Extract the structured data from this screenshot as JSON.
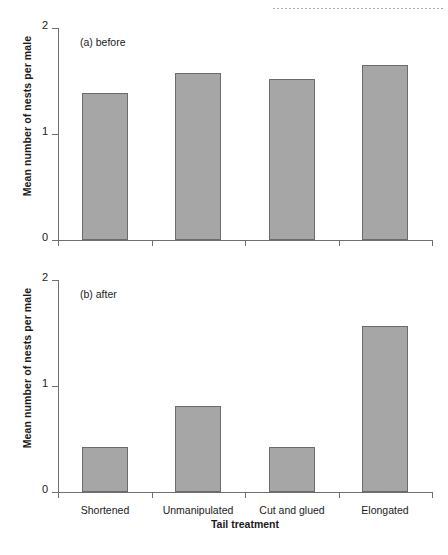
{
  "chart_data": [
    {
      "type": "bar",
      "panel_tag": "(a) before",
      "categories": [
        "Shortened",
        "Unmanipulated",
        "Cut and glued",
        "Elongated"
      ],
      "values": [
        1.39,
        1.58,
        1.52,
        1.65
      ],
      "title": "",
      "xlabel": "",
      "ylabel": "Mean number of nests per male",
      "ylim": [
        0,
        2
      ],
      "yticks": [
        "0",
        "1",
        "2"
      ],
      "ytick_values": [
        0,
        1,
        2
      ],
      "xtick_labels_shown": false,
      "grid": false,
      "legend": "none",
      "bar_fill": "#a6a6a6",
      "bar_edge": "#6b6b6b"
    },
    {
      "type": "bar",
      "panel_tag": "(b) after",
      "categories": [
        "Shortened",
        "Unmanipulated",
        "Cut and glued",
        "Elongated"
      ],
      "values": [
        0.42,
        0.81,
        0.42,
        1.57
      ],
      "title": "",
      "xlabel": "Tail treatment",
      "ylabel": "Mean number of nests per male",
      "ylim": [
        0,
        2
      ],
      "yticks": [
        "0",
        "1",
        "2"
      ],
      "ytick_values": [
        0,
        1,
        2
      ],
      "xtick_labels_shown": true,
      "grid": false,
      "legend": "none",
      "bar_fill": "#a6a6a6",
      "bar_edge": "#6b6b6b"
    }
  ]
}
